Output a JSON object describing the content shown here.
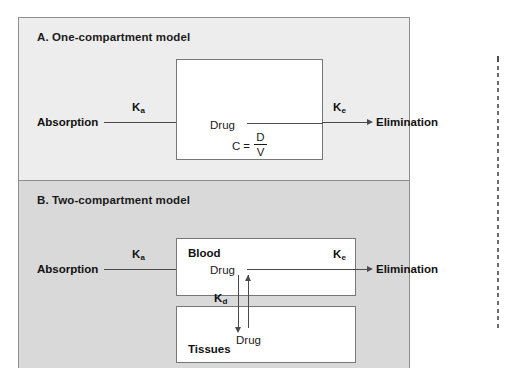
{
  "figure": {
    "background_color": "#ffffff",
    "frame_border_color": "#8e8e8e",
    "line_color": "#4a4a4a"
  },
  "panel_a": {
    "letter": "A.",
    "title": "A. One-compartment model",
    "background_color": "#ededed",
    "input_label": "Absorption",
    "absorption_rate_constant": "K",
    "absorption_rate_subscript": "a",
    "compartment_label": "Drug",
    "formula": {
      "lhs": "C",
      "equals": "=",
      "numerator": "D",
      "denominator": "V"
    },
    "elimination_rate_constant": "K",
    "elimination_rate_subscript": "e",
    "output_label": "Elimination"
  },
  "panel_b": {
    "letter": "B.",
    "title": "B. Two-compartment model",
    "background_color": "#d9d9d9",
    "input_label": "Absorption",
    "absorption_rate_constant": "K",
    "absorption_rate_subscript": "a",
    "blood_compartment_label": "Blood",
    "blood_drug_label": "Drug",
    "distribution_rate_constant": "K",
    "distribution_rate_subscript": "d",
    "tissues_compartment_label": "Tissues",
    "tissues_drug_label": "Drug",
    "elimination_rate_constant": "K",
    "elimination_rate_subscript": "e",
    "output_label": "Elimination"
  }
}
